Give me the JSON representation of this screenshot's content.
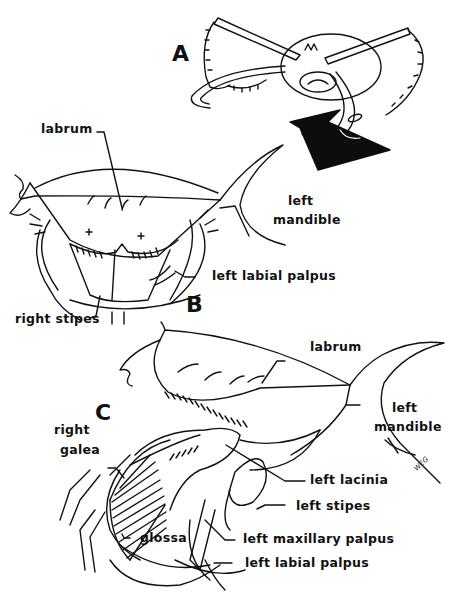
{
  "figure": {
    "panels": [
      {
        "id": "A",
        "letter": "A",
        "description": "dorsal view of head with mouthparts spread, arrow indicating viewing direction"
      },
      {
        "id": "B",
        "letter": "B",
        "labels": {
          "labrum": "labrum",
          "left_mandible_1": "left",
          "left_mandible_2": "mandible",
          "left_labial_palpus": "left labial palpus",
          "right_stipes": "right stipes"
        }
      },
      {
        "id": "C",
        "letter": "C",
        "labels": {
          "labrum": "labrum",
          "left_mandible_1": "left",
          "left_mandible_2": "mandible",
          "right_galea_1": "right",
          "right_galea_2": "galea",
          "left_lacinia": "left lacinia",
          "left_stipes": "left stipes",
          "glossa": "glossa",
          "left_maxillary_palpus": "left maxillary palpus",
          "left_labial_palpus": "left labial palpus"
        }
      }
    ],
    "signature": "WEG",
    "colors": {
      "ink": "#111111",
      "background": "#ffffff"
    }
  }
}
